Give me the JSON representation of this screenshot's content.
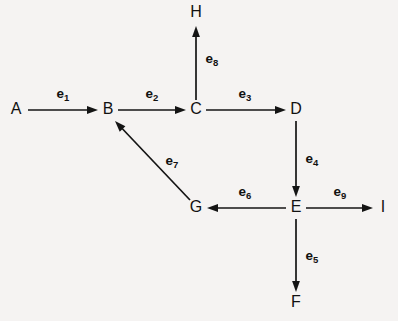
{
  "diagram": {
    "background_color": "#f5f3f2",
    "stroke_color": "#141414",
    "text_color": "#111111",
    "nodes": [
      {
        "id": "A",
        "label": "A",
        "x": 16,
        "y": 110
      },
      {
        "id": "B",
        "label": "B",
        "x": 108,
        "y": 110
      },
      {
        "id": "C",
        "label": "C",
        "x": 196,
        "y": 110
      },
      {
        "id": "D",
        "label": "D",
        "x": 296,
        "y": 110
      },
      {
        "id": "E",
        "label": "E",
        "x": 296,
        "y": 208
      },
      {
        "id": "F",
        "label": "F",
        "x": 296,
        "y": 303
      },
      {
        "id": "G",
        "label": "G",
        "x": 196,
        "y": 208
      },
      {
        "id": "H",
        "label": "H",
        "x": 196,
        "y": 13
      },
      {
        "id": "I",
        "label": "I",
        "x": 383,
        "y": 208
      }
    ],
    "edges": [
      {
        "id": "e1",
        "label": "e",
        "sub": "1",
        "from": "A",
        "to": "B",
        "x1": 28,
        "y1": 110,
        "x2": 98,
        "y2": 110,
        "label_x": 63,
        "label_y": 94,
        "direction": "right"
      },
      {
        "id": "e2",
        "label": "e",
        "sub": "2",
        "from": "B",
        "to": "C",
        "x1": 118,
        "y1": 110,
        "x2": 186,
        "y2": 110,
        "label_x": 152,
        "label_y": 94,
        "direction": "right"
      },
      {
        "id": "e3",
        "label": "e",
        "sub": "3",
        "from": "C",
        "to": "D",
        "x1": 206,
        "y1": 110,
        "x2": 286,
        "y2": 110,
        "label_x": 245,
        "label_y": 94,
        "direction": "right"
      },
      {
        "id": "e4",
        "label": "e",
        "sub": "4",
        "from": "D",
        "to": "E",
        "x1": 296,
        "y1": 121,
        "x2": 296,
        "y2": 197,
        "label_x": 312,
        "label_y": 159,
        "direction": "down"
      },
      {
        "id": "e5",
        "label": "e",
        "sub": "5",
        "from": "E",
        "to": "F",
        "x1": 296,
        "y1": 219,
        "x2": 296,
        "y2": 292,
        "label_x": 312,
        "label_y": 256,
        "direction": "down"
      },
      {
        "id": "e6",
        "label": "e",
        "sub": "6",
        "from": "E",
        "to": "G",
        "x1": 286,
        "y1": 208,
        "x2": 207,
        "y2": 208,
        "label_x": 245,
        "label_y": 192,
        "direction": "left"
      },
      {
        "id": "e7",
        "label": "e",
        "sub": "7",
        "from": "G",
        "to": "B",
        "x1": 190,
        "y1": 200,
        "x2": 115,
        "y2": 121,
        "label_x": 172,
        "label_y": 161,
        "direction": "diagonal-up-left"
      },
      {
        "id": "e8",
        "label": "e",
        "sub": "8",
        "from": "C",
        "to": "H",
        "x1": 196,
        "y1": 100,
        "x2": 196,
        "y2": 26,
        "label_x": 212,
        "label_y": 59,
        "direction": "up"
      },
      {
        "id": "e9",
        "label": "e",
        "sub": "9",
        "from": "E",
        "to": "I",
        "x1": 306,
        "y1": 208,
        "x2": 373,
        "y2": 208,
        "label_x": 340,
        "label_y": 192,
        "direction": "right"
      }
    ]
  }
}
